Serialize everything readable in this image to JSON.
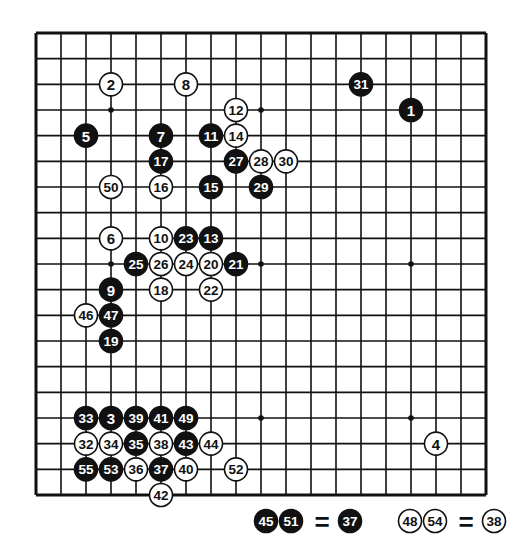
{
  "diagram": {
    "type": "go-game-record",
    "board_size": 19,
    "colors": {
      "black": "#111111",
      "white": "#ffffff",
      "line": "#111111",
      "background": "#ffffff"
    },
    "hoshi": [
      [
        3,
        3
      ],
      [
        3,
        9
      ],
      [
        3,
        15
      ],
      [
        9,
        3
      ],
      [
        9,
        9
      ],
      [
        9,
        15
      ],
      [
        15,
        3
      ],
      [
        15,
        9
      ],
      [
        15,
        15
      ]
    ],
    "stones": [
      {
        "n": "1",
        "color": "black",
        "col": 15,
        "row": 3
      },
      {
        "n": "2",
        "color": "white",
        "col": 3,
        "row": 2
      },
      {
        "n": "3",
        "color": "black",
        "col": 3,
        "row": 15
      },
      {
        "n": "4",
        "color": "white",
        "col": 16,
        "row": 16
      },
      {
        "n": "5",
        "color": "black",
        "col": 2,
        "row": 4
      },
      {
        "n": "6",
        "color": "white",
        "col": 3,
        "row": 8
      },
      {
        "n": "7",
        "color": "black",
        "col": 5,
        "row": 4
      },
      {
        "n": "8",
        "color": "white",
        "col": 6,
        "row": 2
      },
      {
        "n": "9",
        "color": "black",
        "col": 3,
        "row": 10
      },
      {
        "n": "10",
        "color": "white",
        "col": 5,
        "row": 8
      },
      {
        "n": "11",
        "color": "black",
        "col": 7,
        "row": 4
      },
      {
        "n": "12",
        "color": "white",
        "col": 8,
        "row": 3
      },
      {
        "n": "13",
        "color": "black",
        "col": 7,
        "row": 8
      },
      {
        "n": "14",
        "color": "white",
        "col": 8,
        "row": 4
      },
      {
        "n": "15",
        "color": "black",
        "col": 7,
        "row": 6
      },
      {
        "n": "16",
        "color": "white",
        "col": 5,
        "row": 6
      },
      {
        "n": "17",
        "color": "black",
        "col": 5,
        "row": 5
      },
      {
        "n": "18",
        "color": "white",
        "col": 5,
        "row": 10
      },
      {
        "n": "19",
        "color": "black",
        "col": 3,
        "row": 12
      },
      {
        "n": "20",
        "color": "white",
        "col": 7,
        "row": 9
      },
      {
        "n": "21",
        "color": "black",
        "col": 8,
        "row": 9
      },
      {
        "n": "22",
        "color": "white",
        "col": 7,
        "row": 10
      },
      {
        "n": "23",
        "color": "black",
        "col": 6,
        "row": 8
      },
      {
        "n": "24",
        "color": "white",
        "col": 6,
        "row": 9
      },
      {
        "n": "25",
        "color": "black",
        "col": 4,
        "row": 9
      },
      {
        "n": "26",
        "color": "white",
        "col": 5,
        "row": 9
      },
      {
        "n": "27",
        "color": "black",
        "col": 8,
        "row": 5
      },
      {
        "n": "28",
        "color": "white",
        "col": 9,
        "row": 5
      },
      {
        "n": "29",
        "color": "black",
        "col": 9,
        "row": 6
      },
      {
        "n": "30",
        "color": "white",
        "col": 10,
        "row": 5
      },
      {
        "n": "31",
        "color": "black",
        "col": 13,
        "row": 2
      },
      {
        "n": "32",
        "color": "white",
        "col": 2,
        "row": 16
      },
      {
        "n": "33",
        "color": "black",
        "col": 2,
        "row": 15
      },
      {
        "n": "34",
        "color": "white",
        "col": 3,
        "row": 16
      },
      {
        "n": "35",
        "color": "black",
        "col": 4,
        "row": 16
      },
      {
        "n": "36",
        "color": "white",
        "col": 4,
        "row": 17
      },
      {
        "n": "37",
        "color": "black",
        "col": 5,
        "row": 17
      },
      {
        "n": "38",
        "color": "white",
        "col": 5,
        "row": 16
      },
      {
        "n": "39",
        "color": "black",
        "col": 4,
        "row": 15
      },
      {
        "n": "40",
        "color": "white",
        "col": 6,
        "row": 17
      },
      {
        "n": "41",
        "color": "black",
        "col": 5,
        "row": 15
      },
      {
        "n": "42",
        "color": "white",
        "col": 5,
        "row": 18
      },
      {
        "n": "43",
        "color": "black",
        "col": 6,
        "row": 16
      },
      {
        "n": "44",
        "color": "white",
        "col": 7,
        "row": 16
      },
      {
        "n": "46",
        "color": "white",
        "col": 2,
        "row": 11
      },
      {
        "n": "47",
        "color": "black",
        "col": 3,
        "row": 11
      },
      {
        "n": "49",
        "color": "black",
        "col": 6,
        "row": 15
      },
      {
        "n": "50",
        "color": "white",
        "col": 3,
        "row": 6
      },
      {
        "n": "52",
        "color": "white",
        "col": 8,
        "row": 17
      },
      {
        "n": "53",
        "color": "black",
        "col": 3,
        "row": 17
      },
      {
        "n": "55",
        "color": "black",
        "col": 2,
        "row": 17
      }
    ],
    "caption": {
      "groups": [
        {
          "stones": [
            {
              "n": "45",
              "color": "black"
            },
            {
              "n": "51",
              "color": "black"
            }
          ],
          "equals": "=",
          "target": {
            "n": "37",
            "color": "black"
          }
        },
        {
          "stones": [
            {
              "n": "48",
              "color": "white"
            },
            {
              "n": "54",
              "color": "white"
            }
          ],
          "equals": "=",
          "target": {
            "n": "38",
            "color": "white"
          }
        }
      ]
    }
  }
}
